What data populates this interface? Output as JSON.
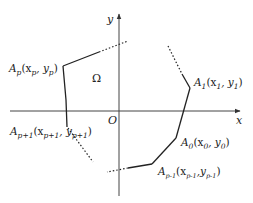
{
  "diagram": {
    "colors": {
      "stroke": "#222222",
      "axis": "#444444",
      "background": "#ffffff"
    },
    "axes": {
      "x_label": "x",
      "y_label": "y",
      "origin_label": "O"
    },
    "region_label": "Ω",
    "vertices": [
      {
        "id": "A_p",
        "name": "A",
        "sub": "p",
        "coord": "(x",
        "xsub": "p",
        "sep": ", y",
        "ysub": "p",
        "close": ")"
      },
      {
        "id": "A_p+1",
        "name": "A",
        "sub": "p+1",
        "coord": "(x",
        "xsub": "p+1",
        "sep": ", y",
        "ysub": "p+1",
        "close": ")"
      },
      {
        "id": "A_1",
        "name": "A",
        "sub": "1",
        "coord": "(x",
        "xsub": "1",
        "sep": ", y",
        "ysub": "1",
        "close": ")"
      },
      {
        "id": "A_0",
        "name": "A",
        "sub": "0",
        "coord": "(x",
        "xsub": "0",
        "sep": ", y",
        "ysub": "0",
        "close": ")"
      },
      {
        "id": "A_p-1",
        "name": "A",
        "sub": "p-1",
        "coord": "(x",
        "xsub": "p-1",
        "sep": ",y",
        "ysub": "p-1",
        "close": ")"
      }
    ]
  }
}
